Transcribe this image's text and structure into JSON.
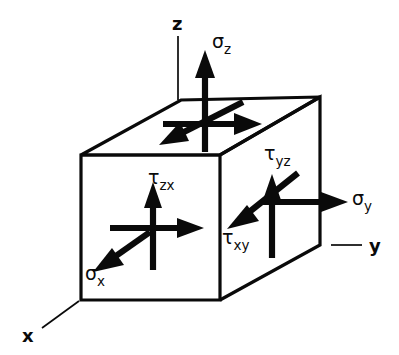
{
  "figure": {
    "background_color": "#ffffff",
    "ink_color": "#0a0a0a",
    "width": 399,
    "height": 355
  },
  "axes": [
    {
      "id": "z",
      "label": "z",
      "label_x": 172,
      "label_y": 30,
      "line": "M178,36 L178,100"
    },
    {
      "id": "y",
      "label": "y",
      "label_x": 369,
      "label_y": 252,
      "line": "M331,245 L362,245"
    },
    {
      "id": "x",
      "label": "x",
      "label_x": 22,
      "label_y": 342,
      "line": "M79,301 L42,328"
    }
  ],
  "cube": {
    "front_face": "M81,155 L220,155 L220,300 L81,300 Z",
    "top_face": "M81,155 L181,100 L320,97 L220,155 Z",
    "right_face": "M220,155 L320,97 L320,245 L220,300 Z"
  },
  "stresses": [
    {
      "id": "sigma-z",
      "symbol": "σ",
      "subscript": "z",
      "label": "σz",
      "kind": "normal",
      "face": "top",
      "direction": "up",
      "label_x": 212,
      "label_y": 48
    },
    {
      "id": "sigma-y",
      "symbol": "σ",
      "subscript": "y",
      "label": "σy",
      "kind": "normal",
      "face": "right",
      "direction": "right",
      "label_x": 352,
      "label_y": 205
    },
    {
      "id": "sigma-x",
      "symbol": "σ",
      "subscript": "x",
      "label": "σx",
      "kind": "normal",
      "face": "front",
      "direction": "down-left",
      "label_x": 85,
      "label_y": 280
    },
    {
      "id": "tau-zx",
      "symbol": "τ",
      "subscript": "zx",
      "label": "τzx",
      "kind": "shear",
      "face": "front",
      "direction": "up",
      "label_x": 148,
      "label_y": 184
    },
    {
      "id": "tau-xy",
      "symbol": "τ",
      "subscript": "xy",
      "label": "τxy",
      "kind": "shear",
      "face": "right",
      "direction": "down-left",
      "label_x": 222,
      "label_y": 244
    },
    {
      "id": "tau-yz",
      "symbol": "τ",
      "subscript": "yz",
      "label": "τyz",
      "kind": "shear",
      "face": "right",
      "direction": "up",
      "label_x": 264,
      "label_y": 160
    }
  ],
  "unlabeled_arrows": [
    {
      "id": "top-face-shear-right",
      "face": "top",
      "direction": "right"
    },
    {
      "id": "top-face-shear-down-left",
      "face": "top",
      "direction": "down-left"
    },
    {
      "id": "front-face-shear-right",
      "face": "front",
      "direction": "right"
    }
  ]
}
